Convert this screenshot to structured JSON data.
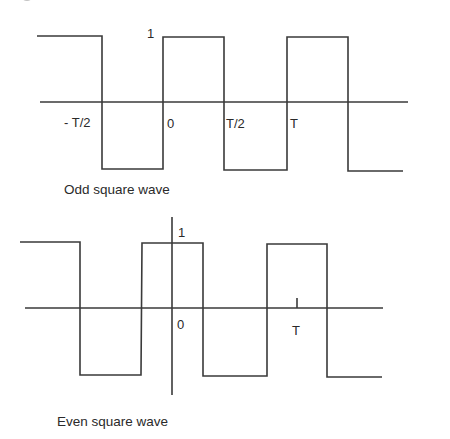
{
  "figures": [
    {
      "id": "odd",
      "caption": "Odd square wave",
      "amplitude_label": "1",
      "axis_labels": {
        "neg_half_period": "- T/2",
        "origin": "0",
        "half_period": "T/2",
        "period": "T"
      }
    },
    {
      "id": "even",
      "caption": "Even square wave",
      "amplitude_label": "1",
      "axis_labels": {
        "origin": "0",
        "period": "T"
      }
    }
  ],
  "style": {
    "line_color": "#3a3a3a",
    "text_color": "#2a2a2a",
    "background": "#ffffff"
  }
}
